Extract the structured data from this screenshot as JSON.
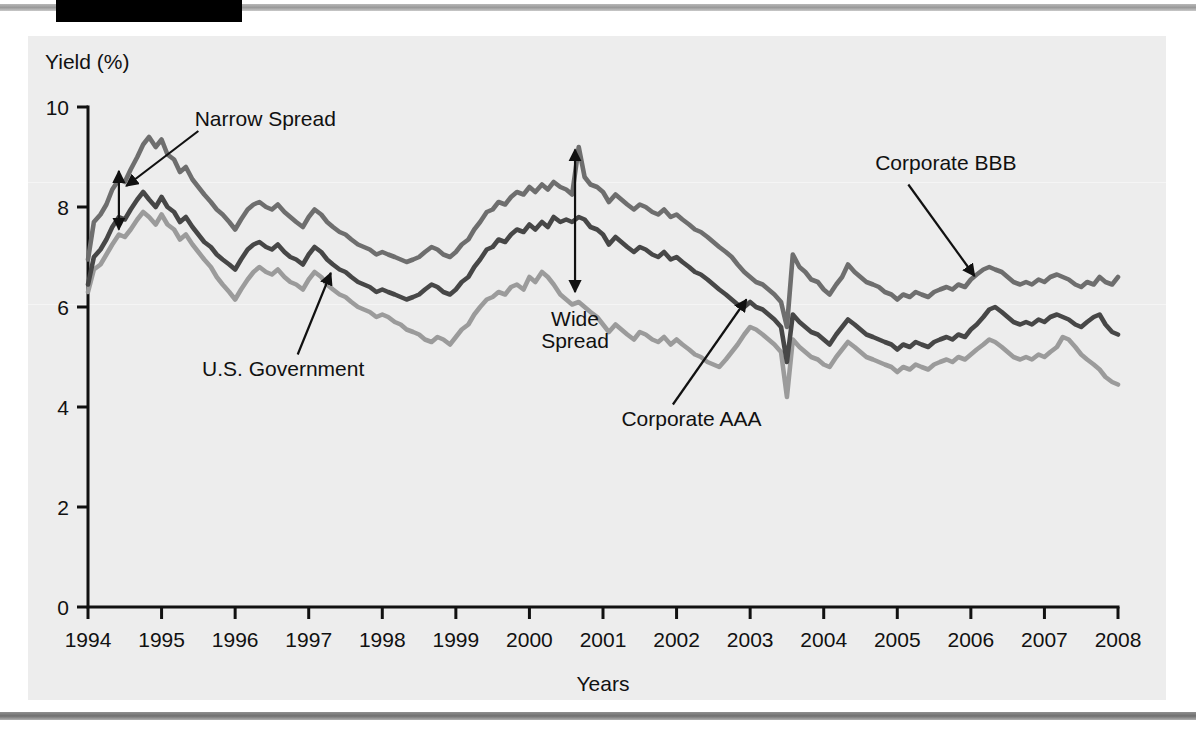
{
  "figure": {
    "y_axis_title": "Yield (%)",
    "x_axis_title": "Years"
  },
  "annotations": {
    "narrow_spread": "Narrow Spread",
    "wide_spread_line1": "Wide",
    "wide_spread_line2": "Spread",
    "us_government": "U.S. Government",
    "corporate_aaa": "Corporate AAA",
    "corporate_bbb": "Corporate BBB"
  },
  "colors": {
    "panel_background": "#ededed",
    "corporate_bbb": "#6e6e6e",
    "corporate_aaa": "#474747",
    "us_government": "#9b9b9b",
    "axis": "#111111",
    "header_tab": "#000000"
  },
  "chart_data": {
    "type": "line",
    "title": "",
    "xlabel": "Years",
    "ylabel": "Yield (%)",
    "xlim": [
      1994,
      2008
    ],
    "ylim": [
      0,
      10
    ],
    "yticks": [
      0,
      2,
      4,
      6,
      8,
      10
    ],
    "xticks": [
      1994,
      1995,
      1996,
      1997,
      1998,
      1999,
      2000,
      2001,
      2002,
      2003,
      2004,
      2005,
      2006,
      2007,
      2008
    ],
    "grid": false,
    "legend": "annotated-inline",
    "x": [
      1994.0,
      1994.08,
      1994.17,
      1994.25,
      1994.33,
      1994.42,
      1994.5,
      1994.58,
      1994.67,
      1994.75,
      1994.83,
      1994.92,
      1995.0,
      1995.08,
      1995.17,
      1995.25,
      1995.33,
      1995.42,
      1995.5,
      1995.58,
      1995.67,
      1995.75,
      1995.83,
      1995.92,
      1996.0,
      1996.08,
      1996.17,
      1996.25,
      1996.33,
      1996.42,
      1996.5,
      1996.58,
      1996.67,
      1996.75,
      1996.83,
      1996.92,
      1997.0,
      1997.08,
      1997.17,
      1997.25,
      1997.33,
      1997.42,
      1997.5,
      1997.58,
      1997.67,
      1997.75,
      1997.83,
      1997.92,
      1998.0,
      1998.08,
      1998.17,
      1998.25,
      1998.33,
      1998.42,
      1998.5,
      1998.58,
      1998.67,
      1998.75,
      1998.83,
      1998.92,
      1999.0,
      1999.08,
      1999.17,
      1999.25,
      1999.33,
      1999.42,
      1999.5,
      1999.58,
      1999.67,
      1999.75,
      1999.83,
      1999.92,
      2000.0,
      2000.08,
      2000.17,
      2000.25,
      2000.33,
      2000.42,
      2000.5,
      2000.58,
      2000.67,
      2000.75,
      2000.83,
      2000.92,
      2001.0,
      2001.08,
      2001.17,
      2001.25,
      2001.33,
      2001.42,
      2001.5,
      2001.58,
      2001.67,
      2001.75,
      2001.83,
      2001.92,
      2002.0,
      2002.08,
      2002.17,
      2002.25,
      2002.33,
      2002.42,
      2002.5,
      2002.58,
      2002.67,
      2002.75,
      2002.83,
      2002.92,
      2003.0,
      2003.08,
      2003.17,
      2003.25,
      2003.33,
      2003.42,
      2003.5,
      2003.58,
      2003.67,
      2003.75,
      2003.83,
      2003.92,
      2004.0,
      2004.08,
      2004.17,
      2004.25,
      2004.33,
      2004.42,
      2004.5,
      2004.58,
      2004.67,
      2004.75,
      2004.83,
      2004.92,
      2005.0,
      2005.08,
      2005.17,
      2005.25,
      2005.33,
      2005.42,
      2005.5,
      2005.58,
      2005.67,
      2005.75,
      2005.83,
      2005.92,
      2006.0,
      2006.08,
      2006.17,
      2006.25,
      2006.33,
      2006.42,
      2006.5,
      2006.58,
      2006.67,
      2006.75,
      2006.83,
      2006.92,
      2007.0,
      2007.08,
      2007.17,
      2007.25,
      2007.33,
      2007.42,
      2007.5,
      2007.58,
      2007.67,
      2007.75,
      2007.83,
      2007.92,
      2008.0
    ],
    "series": [
      {
        "name": "Corporate BBB",
        "color": "#6e6e6e",
        "values": [
          6.95,
          7.7,
          7.85,
          8.05,
          8.35,
          8.55,
          8.5,
          8.75,
          9.0,
          9.25,
          9.4,
          9.2,
          9.35,
          9.05,
          8.95,
          8.7,
          8.8,
          8.55,
          8.4,
          8.25,
          8.1,
          7.95,
          7.85,
          7.7,
          7.55,
          7.75,
          7.95,
          8.05,
          8.1,
          8.0,
          7.95,
          8.05,
          7.9,
          7.8,
          7.7,
          7.6,
          7.8,
          7.95,
          7.85,
          7.7,
          7.6,
          7.5,
          7.45,
          7.35,
          7.25,
          7.2,
          7.15,
          7.05,
          7.1,
          7.05,
          7.0,
          6.95,
          6.9,
          6.95,
          7.0,
          7.1,
          7.2,
          7.15,
          7.05,
          7.0,
          7.1,
          7.25,
          7.35,
          7.55,
          7.7,
          7.9,
          7.95,
          8.1,
          8.05,
          8.2,
          8.3,
          8.25,
          8.4,
          8.3,
          8.45,
          8.35,
          8.5,
          8.4,
          8.35,
          8.25,
          9.2,
          8.6,
          8.45,
          8.4,
          8.3,
          8.1,
          8.25,
          8.15,
          8.05,
          7.95,
          8.05,
          8.0,
          7.9,
          7.85,
          7.95,
          7.8,
          7.85,
          7.75,
          7.65,
          7.55,
          7.5,
          7.4,
          7.3,
          7.2,
          7.1,
          7.0,
          6.85,
          6.7,
          6.6,
          6.5,
          6.45,
          6.35,
          6.25,
          6.1,
          5.6,
          7.05,
          6.8,
          6.7,
          6.55,
          6.5,
          6.35,
          6.25,
          6.45,
          6.6,
          6.85,
          6.7,
          6.6,
          6.5,
          6.45,
          6.4,
          6.3,
          6.25,
          6.15,
          6.25,
          6.2,
          6.3,
          6.25,
          6.2,
          6.3,
          6.35,
          6.4,
          6.35,
          6.45,
          6.4,
          6.55,
          6.65,
          6.75,
          6.8,
          6.75,
          6.7,
          6.6,
          6.5,
          6.45,
          6.5,
          6.45,
          6.55,
          6.5,
          6.6,
          6.65,
          6.6,
          6.55,
          6.45,
          6.4,
          6.5,
          6.45,
          6.6,
          6.5,
          6.45,
          6.6
        ]
      },
      {
        "name": "Corporate AAA",
        "color": "#474747",
        "values": [
          6.45,
          7.0,
          7.15,
          7.35,
          7.6,
          7.8,
          7.75,
          7.95,
          8.15,
          8.3,
          8.15,
          8.0,
          8.2,
          8.0,
          7.9,
          7.7,
          7.8,
          7.6,
          7.45,
          7.3,
          7.2,
          7.05,
          6.95,
          6.85,
          6.75,
          6.95,
          7.15,
          7.25,
          7.3,
          7.2,
          7.15,
          7.25,
          7.1,
          7.0,
          6.95,
          6.85,
          7.05,
          7.2,
          7.1,
          6.95,
          6.85,
          6.75,
          6.7,
          6.6,
          6.5,
          6.45,
          6.4,
          6.3,
          6.35,
          6.3,
          6.25,
          6.2,
          6.15,
          6.2,
          6.25,
          6.35,
          6.45,
          6.4,
          6.3,
          6.25,
          6.35,
          6.5,
          6.6,
          6.8,
          6.95,
          7.15,
          7.2,
          7.35,
          7.3,
          7.45,
          7.55,
          7.5,
          7.65,
          7.55,
          7.7,
          7.6,
          7.8,
          7.7,
          7.75,
          7.7,
          7.8,
          7.75,
          7.6,
          7.55,
          7.45,
          7.25,
          7.4,
          7.3,
          7.2,
          7.1,
          7.2,
          7.15,
          7.05,
          7.0,
          7.1,
          6.95,
          7.0,
          6.9,
          6.8,
          6.7,
          6.65,
          6.55,
          6.45,
          6.35,
          6.25,
          6.15,
          6.05,
          6.0,
          6.1,
          6.0,
          5.95,
          5.85,
          5.75,
          5.6,
          4.9,
          5.85,
          5.7,
          5.6,
          5.5,
          5.45,
          5.35,
          5.25,
          5.45,
          5.6,
          5.75,
          5.65,
          5.55,
          5.45,
          5.4,
          5.35,
          5.3,
          5.25,
          5.15,
          5.25,
          5.2,
          5.3,
          5.25,
          5.2,
          5.3,
          5.35,
          5.4,
          5.35,
          5.45,
          5.4,
          5.55,
          5.65,
          5.8,
          5.95,
          6.0,
          5.9,
          5.8,
          5.7,
          5.65,
          5.7,
          5.65,
          5.75,
          5.7,
          5.8,
          5.85,
          5.8,
          5.75,
          5.65,
          5.6,
          5.7,
          5.8,
          5.85,
          5.65,
          5.5,
          5.45
        ]
      },
      {
        "name": "U.S. Government",
        "color": "#9b9b9b",
        "values": [
          6.3,
          6.75,
          6.85,
          7.05,
          7.25,
          7.45,
          7.4,
          7.55,
          7.75,
          7.9,
          7.8,
          7.65,
          7.85,
          7.65,
          7.55,
          7.35,
          7.45,
          7.25,
          7.1,
          6.95,
          6.8,
          6.6,
          6.45,
          6.3,
          6.15,
          6.35,
          6.55,
          6.7,
          6.8,
          6.7,
          6.65,
          6.75,
          6.6,
          6.5,
          6.45,
          6.35,
          6.55,
          6.7,
          6.6,
          6.45,
          6.35,
          6.25,
          6.2,
          6.1,
          6.0,
          5.95,
          5.9,
          5.8,
          5.85,
          5.8,
          5.7,
          5.65,
          5.55,
          5.5,
          5.45,
          5.35,
          5.3,
          5.4,
          5.35,
          5.25,
          5.4,
          5.55,
          5.65,
          5.85,
          6.0,
          6.15,
          6.2,
          6.3,
          6.25,
          6.4,
          6.45,
          6.35,
          6.6,
          6.5,
          6.7,
          6.6,
          6.45,
          6.25,
          6.15,
          6.05,
          6.1,
          6.0,
          5.9,
          5.8,
          5.65,
          5.5,
          5.65,
          5.55,
          5.45,
          5.35,
          5.5,
          5.45,
          5.35,
          5.3,
          5.4,
          5.25,
          5.35,
          5.25,
          5.15,
          5.05,
          5.0,
          4.9,
          4.85,
          4.8,
          4.95,
          5.1,
          5.25,
          5.45,
          5.6,
          5.55,
          5.45,
          5.35,
          5.25,
          5.1,
          4.2,
          5.35,
          5.2,
          5.1,
          5.0,
          4.95,
          4.85,
          4.8,
          5.0,
          5.15,
          5.3,
          5.2,
          5.1,
          5.0,
          4.95,
          4.9,
          4.85,
          4.8,
          4.7,
          4.8,
          4.75,
          4.85,
          4.8,
          4.75,
          4.85,
          4.9,
          4.95,
          4.9,
          5.0,
          4.95,
          5.05,
          5.15,
          5.25,
          5.35,
          5.3,
          5.2,
          5.1,
          5.0,
          4.95,
          5.0,
          4.95,
          5.05,
          5.0,
          5.1,
          5.2,
          5.4,
          5.35,
          5.2,
          5.05,
          4.95,
          4.85,
          4.75,
          4.6,
          4.5,
          4.45
        ]
      }
    ]
  }
}
